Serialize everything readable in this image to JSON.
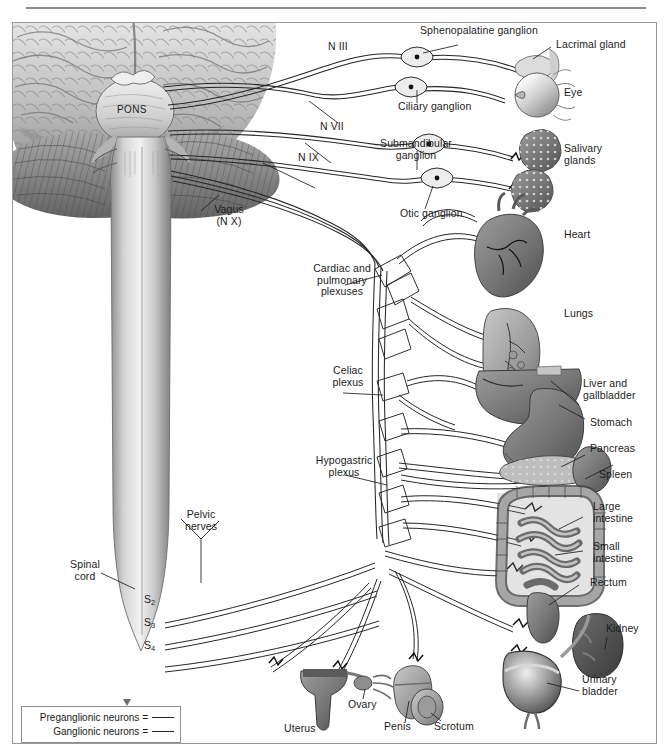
{
  "figure": {
    "title_rule": true
  },
  "brain": {
    "pons_label": "PONS"
  },
  "cranial_nerves": [
    {
      "id": "n3",
      "label": "N III"
    },
    {
      "id": "n7",
      "label": "N VII"
    },
    {
      "id": "n9",
      "label": "N IX"
    },
    {
      "id": "n10",
      "label": "Vagus\n(N X)"
    }
  ],
  "ganglia": [
    {
      "id": "sphenopalatine",
      "label": "Sphenopalatine ganglion"
    },
    {
      "id": "ciliary",
      "label": "Ciliary ganglion"
    },
    {
      "id": "submandibular",
      "label": "Submandibular\nganglion"
    },
    {
      "id": "otic",
      "label": "Otic ganglion"
    }
  ],
  "plexuses": [
    {
      "id": "cardiopulmonary",
      "label": "Cardiac and\npulmonary\nplexuses"
    },
    {
      "id": "celiac",
      "label": "Celiac\nplexus"
    },
    {
      "id": "hypogastric",
      "label": "Hypogastric\nplexus"
    }
  ],
  "spinal": {
    "cord_label": "Spinal\ncord",
    "pelvic_nerves_label": "Pelvic\nnerves",
    "segments": [
      {
        "root": "S",
        "index": "2"
      },
      {
        "root": "S",
        "index": "3"
      },
      {
        "root": "S",
        "index": "4"
      }
    ]
  },
  "organs": [
    {
      "id": "lacrimal-gland",
      "label": "Lacrimal gland"
    },
    {
      "id": "eye",
      "label": "Eye"
    },
    {
      "id": "salivary-glands",
      "label": "Salivary\nglands"
    },
    {
      "id": "heart",
      "label": "Heart"
    },
    {
      "id": "lungs",
      "label": "Lungs"
    },
    {
      "id": "liver",
      "label": "Liver and\ngallbladder"
    },
    {
      "id": "stomach",
      "label": "Stomach"
    },
    {
      "id": "pancreas",
      "label": "Pancreas"
    },
    {
      "id": "spleen",
      "label": "Spleen"
    },
    {
      "id": "large-intestine",
      "label": "Large\nintestine"
    },
    {
      "id": "small-intestine",
      "label": "Small\nintestine"
    },
    {
      "id": "rectum",
      "label": "Rectum"
    },
    {
      "id": "kidney",
      "label": "Kidney"
    },
    {
      "id": "urinary-bladder",
      "label": "Urinary\nbladder"
    },
    {
      "id": "uterus",
      "label": "Uterus"
    },
    {
      "id": "ovary",
      "label": "Ovary"
    },
    {
      "id": "penis",
      "label": "Penis"
    },
    {
      "id": "scrotum",
      "label": "Scrotum"
    }
  ],
  "legend": {
    "preganglionic": "Preganglionic neurons =",
    "ganglionic": "Ganglionic neurons ="
  },
  "colors": {
    "frame": "#9a9a9a",
    "rule": "#8b8b8b",
    "nerve": "#2a2a2a",
    "text": "#1c1c1c",
    "tissue_light": "#d9d9d9",
    "tissue_mid": "#a8a8a8",
    "tissue_dark": "#6f6f6f",
    "organ_dark": "#5b5b5b"
  }
}
